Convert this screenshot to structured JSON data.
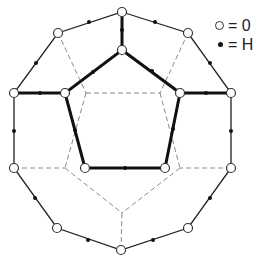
{
  "diagram": {
    "title": "",
    "legend": [
      {
        "symbol": "open-circle",
        "label": "○ = 0",
        "text": "= 0"
      },
      {
        "symbol": "filled-dot",
        "label": "• = H",
        "text": "= H"
      }
    ],
    "colors": {
      "line": "#222222",
      "dashed": "#888888",
      "background": "#ffffff"
    },
    "oxygen_vertices": {
      "outer": [
        [
          122,
          12
        ],
        [
          188,
          33
        ],
        [
          231,
          93
        ],
        [
          231,
          168
        ],
        [
          188,
          228
        ],
        [
          121,
          250
        ],
        [
          57,
          228
        ],
        [
          14,
          168
        ],
        [
          14,
          93
        ],
        [
          58,
          33
        ]
      ],
      "inner": [
        [
          122,
          50
        ],
        [
          180,
          93
        ],
        [
          165,
          168
        ],
        [
          85,
          168
        ],
        [
          65,
          93
        ]
      ]
    },
    "back_vertices": [
      [
        86,
        93
      ],
      [
        160,
        93
      ],
      [
        180,
        168
      ],
      [
        122,
        213
      ],
      [
        65,
        168
      ]
    ],
    "outer_edges_with_H": [
      [
        0,
        1
      ],
      [
        1,
        2
      ],
      [
        2,
        3
      ],
      [
        3,
        4
      ],
      [
        4,
        5
      ],
      [
        5,
        6
      ],
      [
        6,
        7
      ],
      [
        7,
        8
      ],
      [
        8,
        9
      ],
      [
        9,
        0
      ]
    ],
    "spoke_edges_with_H": [
      [
        "outer0",
        "inner0"
      ],
      [
        "outer2",
        "inner1"
      ],
      [
        "outer8",
        "inner4"
      ]
    ],
    "inner_edges_with_H": [
      [
        0,
        1
      ],
      [
        1,
        2
      ],
      [
        2,
        3
      ],
      [
        3,
        4
      ],
      [
        4,
        0
      ]
    ]
  }
}
